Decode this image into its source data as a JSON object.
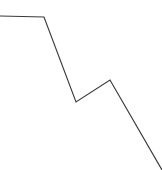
{
  "figure": {
    "background_color": "#ffffff",
    "width": 162,
    "height": 170,
    "title": "",
    "has_axes": false,
    "has_gridlines": false,
    "has_legend": false,
    "has_tick_labels": false
  },
  "chart_data": {
    "type": "line",
    "title": "",
    "xlabel": "",
    "ylabel": "",
    "grid": false,
    "legend_position": "none",
    "axis_visible": false,
    "tick_labels": [],
    "annotations": [],
    "xlim": [
      0,
      162
    ],
    "ylim": [
      0,
      170
    ],
    "series": [
      {
        "name": "series-1",
        "color": "#3a3a3a",
        "line_width": 1.15,
        "marker": "none",
        "points_pixel": [
          [
            0,
            16
          ],
          [
            44,
            17
          ],
          [
            76,
            102
          ],
          [
            110,
            80
          ],
          [
            162,
            170
          ]
        ],
        "x": [
          0,
          44,
          76,
          110,
          162
        ],
        "values": [
          154,
          153,
          68,
          90,
          0
        ]
      }
    ],
    "description": "Unlabeled polyline: flat plateau at top-left, steep decline to a valley, partial recovery to a local peak, then a long steep decline exiting at the bottom-right corner."
  }
}
